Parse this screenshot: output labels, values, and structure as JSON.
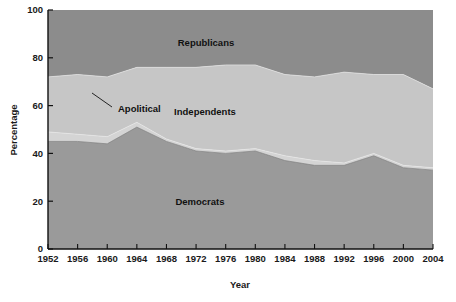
{
  "chart_data": {
    "type": "area",
    "title": "",
    "subtitle": "",
    "xlabel": "Year",
    "ylabel": "Percentage",
    "xlim": [
      1952,
      2004
    ],
    "ylim": [
      0,
      100
    ],
    "grid": false,
    "legend_position": "inline-labels",
    "stacked": true,
    "stack_order_bottom_to_top": [
      "Democrats",
      "Apolitical",
      "Independents",
      "Republicans"
    ],
    "x": [
      1952,
      1956,
      1960,
      1964,
      1968,
      1972,
      1976,
      1980,
      1984,
      1988,
      1992,
      1996,
      2000,
      2004
    ],
    "xtick_labels": [
      "1952",
      "1956",
      "1960",
      "1964",
      "1968",
      "1972",
      "1976",
      "1980",
      "1984",
      "1988",
      "1992",
      "1996",
      "2000",
      "2004"
    ],
    "ytick_labels": [
      "0",
      "20",
      "40",
      "60",
      "80",
      "100"
    ],
    "yticks": [
      0,
      20,
      40,
      60,
      80,
      100
    ],
    "series": [
      {
        "name": "Democrats",
        "color": "#9a9a9a",
        "values": [
          45,
          45,
          44,
          51,
          45,
          41,
          40,
          41,
          37,
          35,
          35,
          39,
          34,
          33
        ]
      },
      {
        "name": "Apolitical",
        "color": "#cfcfcf",
        "values": [
          4,
          3,
          3,
          2,
          1,
          1,
          1,
          1,
          2,
          2,
          1,
          1,
          1,
          1
        ]
      },
      {
        "name": "Independents",
        "color": "#c6c6c6",
        "values": [
          23,
          25,
          25,
          23,
          30,
          34,
          36,
          35,
          34,
          35,
          38,
          33,
          38,
          33
        ]
      },
      {
        "name": "Republicans",
        "color": "#8c8c8c",
        "values": [
          28,
          27,
          28,
          24,
          24,
          24,
          23,
          23,
          27,
          28,
          26,
          27,
          27,
          33
        ]
      }
    ],
    "cumulative_boundaries": {
      "democrats_top": [
        45,
        45,
        44,
        51,
        45,
        41,
        40,
        41,
        37,
        35,
        35,
        39,
        34,
        33
      ],
      "apolitical_top": [
        49,
        48,
        47,
        53,
        46,
        42,
        41,
        42,
        39,
        37,
        36,
        40,
        35,
        34
      ],
      "independents_top": [
        72,
        73,
        72,
        76,
        76,
        76,
        77,
        77,
        73,
        72,
        74,
        73,
        73,
        67
      ],
      "republicans_top": [
        100,
        100,
        100,
        100,
        100,
        100,
        100,
        100,
        100,
        100,
        100,
        100,
        100,
        100
      ]
    },
    "annotations": [
      {
        "name": "Republicans",
        "text": "Republicans",
        "x_px": 206,
        "y_px": 46
      },
      {
        "name": "Apolitical",
        "text": "Apolitical",
        "x_px": 118,
        "y_px": 112,
        "leader_line": true
      },
      {
        "name": "Independents",
        "text": "Independents",
        "x_px": 205,
        "y_px": 115
      },
      {
        "name": "Democrats",
        "text": "Democrats",
        "x_px": 200,
        "y_px": 205
      }
    ]
  },
  "axes": {
    "y_title": "Percentage",
    "x_title": "Year"
  },
  "colors": {
    "democrats": "#9a9a9a",
    "apolitical": "#cfcfcf",
    "independents": "#c6c6c6",
    "republicans": "#8c8c8c",
    "axis": "#111111",
    "text": "#1a1a1a",
    "background": "#ffffff"
  }
}
